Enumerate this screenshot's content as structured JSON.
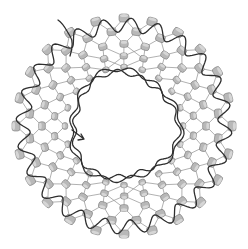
{
  "figure": {
    "center": [
      124,
      126
    ],
    "rings": [
      {
        "radius": 108,
        "count": 24,
        "phase": 0
      },
      {
        "radius": 95,
        "count": 24,
        "phase": 7.5
      },
      {
        "radius": 82,
        "count": 24,
        "phase": 0
      },
      {
        "radius": 70,
        "count": 22,
        "phase": 8
      },
      {
        "radius": 59,
        "count": 20,
        "phase": 0
      }
    ],
    "outer_chain": {
      "radius": 101,
      "amplitude": 7,
      "waves": 24
    },
    "inner_chains": [
      {
        "radius": 52,
        "amplitude": 2.5,
        "waves": 14,
        "phase": 0
      },
      {
        "radius": 55,
        "amplitude": 2.5,
        "waves": 12,
        "phase": 30
      }
    ],
    "colors": {
      "bead_fill": "#b8b8b8",
      "bead_highlight": "#d6d6d6",
      "bead_stroke": "#7a7a7a",
      "chain": "#2e2e2e",
      "link": "#8f8f8f",
      "background": "#ffffff"
    }
  }
}
